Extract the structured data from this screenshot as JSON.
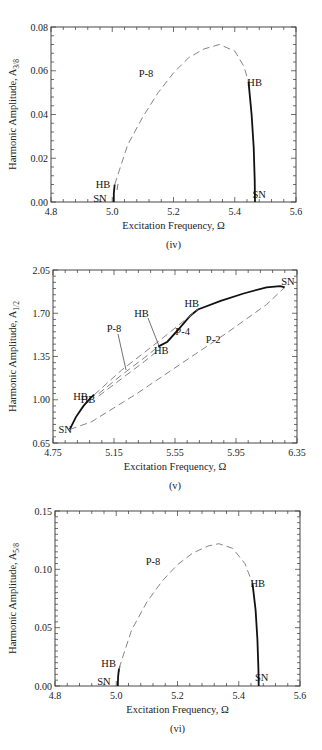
{
  "chart_data": [
    {
      "type": "line",
      "panel_label": "(iv)",
      "title": "",
      "xlabel": "Excitation Frequency,  Ω",
      "ylabel": "Harmonic Amplitude, A",
      "ylabel_subscript": "3/8",
      "xlim": [
        4.8,
        5.6
      ],
      "ylim": [
        0.0,
        0.08
      ],
      "xticks": [
        4.8,
        5.0,
        5.2,
        5.4,
        5.6
      ],
      "xtick_labels": [
        "4.8",
        "5.0",
        "5.2",
        "5.4",
        "5.6"
      ],
      "yticks": [
        0.0,
        0.02,
        0.04,
        0.06,
        0.08
      ],
      "ytick_labels": [
        "0.00",
        "0.02",
        "0.04",
        "0.06",
        "0.08"
      ],
      "grid": false,
      "series": [
        {
          "name": "P-8 stable (left)",
          "style": "solid",
          "x": [
            5.005,
            5.005,
            5.008
          ],
          "y": [
            0.0,
            0.004,
            0.008
          ]
        },
        {
          "name": "P-8 unstable",
          "style": "dashed",
          "x": [
            5.008,
            5.05,
            5.1,
            5.15,
            5.2,
            5.25,
            5.3,
            5.35,
            5.4,
            5.43,
            5.445
          ],
          "y": [
            0.008,
            0.026,
            0.039,
            0.05,
            0.059,
            0.066,
            0.07,
            0.072,
            0.069,
            0.062,
            0.055
          ]
        },
        {
          "name": "P-8 stable (right)",
          "style": "solid",
          "x": [
            5.445,
            5.455,
            5.462,
            5.465,
            5.466
          ],
          "y": [
            0.055,
            0.04,
            0.025,
            0.01,
            0.0
          ]
        }
      ],
      "annotations": [
        {
          "text": "P-8",
          "x": 5.11,
          "y": 0.057
        },
        {
          "text": "HB",
          "x": 4.97,
          "y": 0.0065
        },
        {
          "text": "SN",
          "x": 4.96,
          "y": 0.0
        },
        {
          "text": "HB",
          "x": 5.465,
          "y": 0.053
        },
        {
          "text": "SN",
          "x": 5.48,
          "y": 0.002
        }
      ]
    },
    {
      "type": "line",
      "panel_label": "(v)",
      "title": "",
      "xlabel": "Excitation Frequency,  Ω",
      "ylabel": "Harmonic Amplitude, A",
      "ylabel_subscript": "1/2",
      "xlim": [
        4.75,
        6.35
      ],
      "ylim": [
        0.65,
        2.05
      ],
      "xticks": [
        4.75,
        5.15,
        5.55,
        5.95,
        6.35
      ],
      "xtick_labels": [
        "4.75",
        "5.15",
        "5.55",
        "5.95",
        "6.35"
      ],
      "yticks": [
        0.65,
        1.0,
        1.35,
        1.7,
        2.05
      ],
      "ytick_labels": [
        "0.65",
        "1.00",
        "1.35",
        "1.70",
        "2.05"
      ],
      "grid": false,
      "series": [
        {
          "name": "P-2 stable upper",
          "style": "solid",
          "x": [
            4.86,
            4.9,
            4.95,
            5.0,
            5.02
          ],
          "y": [
            0.76,
            0.86,
            0.95,
            1.02,
            1.04
          ]
        },
        {
          "name": "P-2 stable middle",
          "style": "solid",
          "x": [
            5.44,
            5.5,
            5.58,
            5.65,
            5.7
          ],
          "y": [
            1.43,
            1.47,
            1.58,
            1.68,
            1.73
          ]
        },
        {
          "name": "P-2 stable top",
          "style": "solid",
          "x": [
            5.7,
            5.85,
            6.0,
            6.15,
            6.24,
            6.27
          ],
          "y": [
            1.73,
            1.8,
            1.86,
            1.91,
            1.92,
            1.91
          ]
        },
        {
          "name": "P-2 unstable lower",
          "style": "dashed",
          "x": [
            4.86,
            5.0,
            5.3,
            5.6,
            5.9,
            6.15,
            6.27
          ],
          "y": [
            0.76,
            0.82,
            1.05,
            1.3,
            1.55,
            1.77,
            1.91
          ]
        },
        {
          "name": "P-4",
          "style": "dashed",
          "x": [
            5.02,
            5.2,
            5.44,
            5.7
          ],
          "y": [
            1.04,
            1.24,
            1.47,
            1.73
          ]
        },
        {
          "name": "P-8 branch a",
          "style": "dashed",
          "x": [
            5.05,
            5.2,
            5.35,
            5.44
          ],
          "y": [
            1.05,
            1.2,
            1.34,
            1.43
          ]
        },
        {
          "name": "P-8 branch b",
          "style": "dashed",
          "x": [
            5.05,
            5.2,
            5.35,
            5.44
          ],
          "y": [
            1.03,
            1.17,
            1.31,
            1.4
          ]
        }
      ],
      "annotations": [
        {
          "text": "SN",
          "x": 6.29,
          "y": 1.93
        },
        {
          "text": "HB",
          "x": 5.66,
          "y": 1.75
        },
        {
          "text": "HB",
          "x": 5.33,
          "y": 1.67
        },
        {
          "text": "P-8",
          "x": 5.15,
          "y": 1.55
        },
        {
          "text": "P-4",
          "x": 5.6,
          "y": 1.52
        },
        {
          "text": "P-2",
          "x": 5.8,
          "y": 1.46
        },
        {
          "text": "HB",
          "x": 5.46,
          "y": 1.37
        },
        {
          "text": "HB",
          "x": 4.93,
          "y": 1.0
        },
        {
          "text": "HB",
          "x": 4.98,
          "y": 0.97
        },
        {
          "text": "SN",
          "x": 4.83,
          "y": 0.73
        }
      ]
    },
    {
      "type": "line",
      "panel_label": "(vi)",
      "title": "",
      "xlabel": "Excitation Frequency,  Ω",
      "ylabel": "Harmonic Amplitude, A",
      "ylabel_subscript": "5/8",
      "xlim": [
        4.8,
        5.6
      ],
      "ylim": [
        0.0,
        0.15
      ],
      "xticks": [
        4.8,
        5.0,
        5.2,
        5.4,
        5.6
      ],
      "xtick_labels": [
        "4.8",
        "5.0",
        "5.2",
        "5.4",
        "5.6"
      ],
      "yticks": [
        0.0,
        0.05,
        0.1,
        0.15
      ],
      "ytick_labels": [
        "0.00",
        "0.05",
        "0.10",
        "0.15"
      ],
      "grid": false,
      "series": [
        {
          "name": "P-8 stable (left)",
          "style": "solid",
          "x": [
            5.005,
            5.006,
            5.009
          ],
          "y": [
            0.0,
            0.008,
            0.015
          ]
        },
        {
          "name": "P-8 unstable",
          "style": "dashed",
          "x": [
            5.009,
            5.05,
            5.1,
            5.15,
            5.2,
            5.25,
            5.3,
            5.335,
            5.38,
            5.42,
            5.445
          ],
          "y": [
            0.015,
            0.048,
            0.072,
            0.09,
            0.104,
            0.114,
            0.12,
            0.122,
            0.118,
            0.105,
            0.088
          ]
        },
        {
          "name": "P-8 stable (right)",
          "style": "solid",
          "x": [
            5.445,
            5.455,
            5.461,
            5.464,
            5.465
          ],
          "y": [
            0.088,
            0.065,
            0.04,
            0.015,
            0.0
          ]
        }
      ],
      "annotations": [
        {
          "text": "P-8",
          "x": 5.12,
          "y": 0.104
        },
        {
          "text": "HB",
          "x": 4.975,
          "y": 0.016
        },
        {
          "text": "SN",
          "x": 4.96,
          "y": 0.001
        },
        {
          "text": "HB",
          "x": 5.462,
          "y": 0.085
        },
        {
          "text": "SN",
          "x": 5.475,
          "y": 0.004
        }
      ]
    }
  ],
  "layout": [
    {
      "x0": 51,
      "x1": 296,
      "yTop": 27,
      "yBot": 202,
      "minor_x": 4,
      "minor_y": 4
    },
    {
      "x0": 53,
      "x1": 297,
      "yTop": 270,
      "yBot": 443,
      "minor_x": 4,
      "minor_y": 6
    },
    {
      "x0": 55,
      "x1": 300,
      "yTop": 511,
      "yBot": 686,
      "minor_x": 4,
      "minor_y": 9
    }
  ]
}
